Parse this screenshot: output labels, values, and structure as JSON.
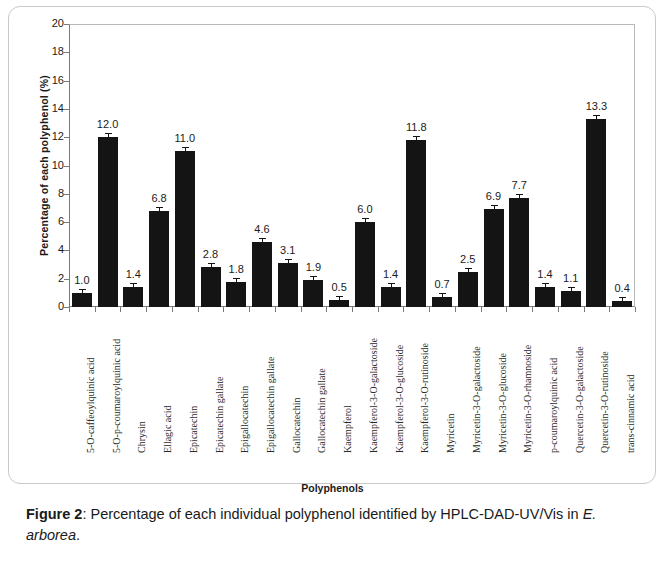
{
  "figure": {
    "caption_label": "Figure 2",
    "caption_sep": ": ",
    "caption_text_1": "Percentage of each individual polyphenol identified by HPLC-DAD-UV/Vis in ",
    "caption_italic": "E. arborea",
    "caption_text_2": "."
  },
  "chart_data": {
    "type": "bar",
    "title": "",
    "xlabel": "Polyphenols",
    "ylabel": "Percentage of each polyphenol (%)",
    "ylim": [
      0,
      20
    ],
    "ytick_step": 2,
    "yticks": [
      "0",
      "2",
      "4",
      "6",
      "8",
      "10",
      "12",
      "14",
      "16",
      "18",
      "20"
    ],
    "grid": false,
    "legend": null,
    "bar_color": "#141414",
    "error_bars": true,
    "categories": [
      "5-O-caffeoylquinic acid",
      "5-O-p-coumaroylquinic acid",
      "Chrysin",
      "Ellagic acid",
      "Epicatechin",
      "Epicatechin gallate",
      "Epigallocatechin",
      "Epigallocatechin gallate",
      "Gallocatechin",
      "Gallocatechin gallate",
      "Kaempferol",
      "Kaempferol-3-O-galactoside",
      "Kaempferol-3-O-glucoside",
      "Kaempferol-3-O-rutinoside",
      "Myricetin",
      "Myricetin-3-O-galactoside",
      "Myricetin-3-O-glucoside",
      "Myricetin-3-O-rhamnoside",
      "p-coumaroylquinic acid",
      "Quercetin-3-O-galactoside",
      "Quercetin-3-O-rutinoside",
      "trans-cinnamic acid"
    ],
    "values": [
      1.0,
      12.0,
      1.4,
      6.8,
      11.0,
      2.8,
      1.8,
      4.6,
      3.1,
      1.9,
      0.5,
      6.0,
      1.4,
      11.8,
      0.7,
      2.5,
      6.9,
      7.7,
      1.4,
      1.1,
      13.3,
      0.4
    ],
    "value_labels": [
      "1.0",
      "12.0",
      "1.4",
      "6.8",
      "11.0",
      "2.8",
      "1.8",
      "4.6",
      "3.1",
      "1.9",
      "0.5",
      "6.0",
      "1.4",
      "11.8",
      "0.7",
      "2.5",
      "6.9",
      "7.7",
      "1.4",
      "1.1",
      "13.3",
      "0.4"
    ]
  }
}
